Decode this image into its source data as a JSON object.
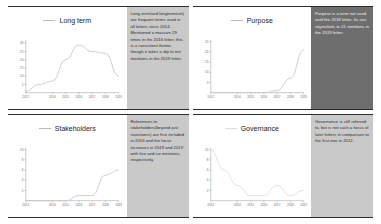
{
  "figure": {
    "panel_count": 4,
    "note_bg_light": "#c9c9c9",
    "note_bg_dark": "#6e6e6e",
    "line_color": "#c6c6c6"
  },
  "panels": [
    {
      "id": "long-term",
      "legend_label": "Long term",
      "note": "Long term/and longtermism) are frequent terms used in all letters since 2014. Mentioned a massive 29 times in the 2016 letter, this is a consistent theme, though it takes a dip to ten mentions in the 2019 letter.",
      "note_style": "light"
    },
    {
      "id": "purpose",
      "legend_label": "Purpose",
      "note": "Purpose is a term not used until the 2018 letter. Its use skyrockets to 21 mentions in the 2019 letter.",
      "note_style": "dark"
    },
    {
      "id": "stakeholders",
      "legend_label": "Stakeholders",
      "note": "References to stakeholders(beyond just investoers) are first included in 2016 and the focus increases in 2018 and 2019 with five and six mentions, respectively.",
      "note_style": "light"
    },
    {
      "id": "governance",
      "legend_label": "Governance",
      "note": "Governance is still referred to, but is not such a focus of later letters in comparison to the first one in 2012.",
      "note_style": "light"
    }
  ],
  "chart_data": [
    {
      "type": "line",
      "title": "Long term",
      "xlabel": "",
      "ylabel": "",
      "x": [
        2012,
        2013,
        2014,
        2015,
        2016,
        2017,
        2018,
        2019
      ],
      "xticklabels": [
        "2012",
        "2014",
        "2015",
        "2016",
        "2017",
        "2018",
        "2019"
      ],
      "yticks": [
        5,
        10,
        15,
        20,
        25,
        30
      ],
      "ylim": [
        0,
        31
      ],
      "xlim": [
        2012,
        2019
      ],
      "values": [
        1,
        5,
        7,
        20,
        29,
        25,
        24,
        10
      ],
      "series": [
        {
          "name": "Long term",
          "values": [
            1,
            5,
            7,
            20,
            29,
            25,
            24,
            10
          ]
        }
      ],
      "grid": false,
      "legend_position": "top-center"
    },
    {
      "type": "line",
      "title": "Purpose",
      "xlabel": "",
      "ylabel": "",
      "x": [
        2012,
        2013,
        2014,
        2015,
        2016,
        2017,
        2018,
        2019
      ],
      "xticklabels": [
        "2012",
        "2014",
        "2015",
        "2016",
        "2017",
        "2018",
        "2019"
      ],
      "yticks": [
        5,
        10,
        15,
        20,
        25
      ],
      "ylim": [
        0,
        25
      ],
      "xlim": [
        2012,
        2019
      ],
      "values": [
        0,
        0,
        0,
        0,
        0,
        1,
        7,
        21
      ],
      "series": [
        {
          "name": "Purpose",
          "values": [
            0,
            0,
            0,
            0,
            0,
            1,
            7,
            21
          ]
        }
      ],
      "grid": false,
      "legend_position": "top-center"
    },
    {
      "type": "line",
      "title": "Stakeholders",
      "xlabel": "",
      "ylabel": "",
      "x": [
        2012,
        2013,
        2014,
        2015,
        2016,
        2017,
        2018,
        2019
      ],
      "xticklabels": [
        "2012",
        "2014",
        "2015",
        "2016",
        "2017",
        "2018",
        "2019"
      ],
      "yticks": [
        2,
        4,
        6,
        8,
        10
      ],
      "ylim": [
        0,
        10
      ],
      "xlim": [
        2012,
        2019
      ],
      "values": [
        0,
        0,
        0,
        0,
        1,
        1,
        5,
        6
      ],
      "series": [
        {
          "name": "Stakeholders",
          "values": [
            0,
            0,
            0,
            0,
            1,
            1,
            5,
            6
          ]
        }
      ],
      "grid": false,
      "legend_position": "top-center"
    },
    {
      "type": "line",
      "title": "Governance",
      "xlabel": "",
      "ylabel": "",
      "x": [
        2012,
        2013,
        2014,
        2015,
        2016,
        2017,
        2018,
        2019
      ],
      "xticklabels": [
        "2012",
        "2014",
        "2015",
        "2016",
        "2017",
        "2018",
        "2019"
      ],
      "yticks": [
        2,
        4,
        6,
        8,
        10
      ],
      "ylim": [
        0,
        10
      ],
      "xlim": [
        2012,
        2019
      ],
      "values": [
        10,
        6,
        3,
        1,
        1,
        3,
        1,
        2
      ],
      "series": [
        {
          "name": "Governance",
          "values": [
            10,
            6,
            3,
            1,
            1,
            3,
            1,
            2
          ]
        }
      ],
      "grid": false,
      "legend_position": "top-center"
    }
  ]
}
